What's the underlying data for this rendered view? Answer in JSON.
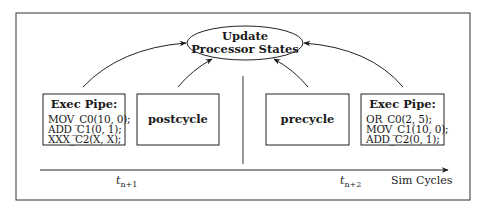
{
  "ellipse": {
    "line1": "Update",
    "line2": "Processor States"
  },
  "left_group": {
    "exec_pipe": {
      "title": "Exec Pipe:",
      "lines": [
        "MOV_C0(10, 0);",
        "ADD_C1(0, 1);",
        "XXX_C2(X, X);"
      ]
    },
    "phase_box": {
      "label": "postcycle"
    }
  },
  "right_group": {
    "phase_box": {
      "label": "precycle"
    },
    "exec_pipe": {
      "title": "Exec Pipe:",
      "lines": [
        "OR_C0(2, 5);",
        "MOV_C1(10, 0);",
        "ADD_C2(0, 1);"
      ]
    }
  },
  "axis": {
    "label": "Sim Cycles",
    "ticks": [
      {
        "base": "t",
        "sub": "n+1"
      },
      {
        "base": "t",
        "sub": "n+2"
      }
    ]
  }
}
